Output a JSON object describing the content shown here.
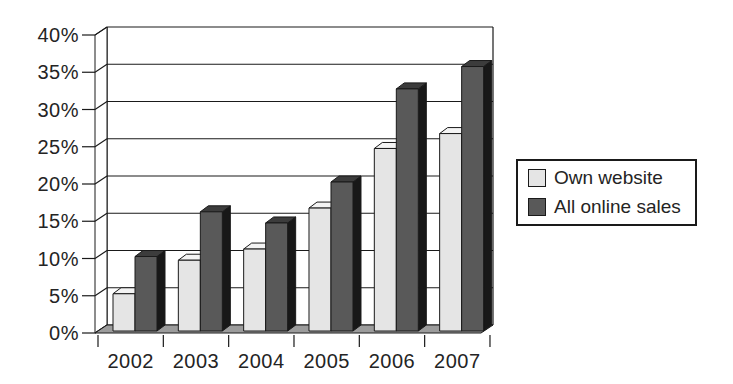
{
  "chart_data": {
    "type": "bar",
    "style": "3d-column",
    "title": "",
    "xlabel": "",
    "ylabel": "",
    "categories": [
      "2002",
      "2003",
      "2004",
      "2005",
      "2006",
      "2007"
    ],
    "series": [
      {
        "name": "Own website",
        "values": [
          5,
          9.5,
          11,
          16.5,
          24.5,
          26.5
        ]
      },
      {
        "name": "All online sales",
        "values": [
          10,
          16,
          14.5,
          20,
          32.5,
          35.5
        ]
      }
    ],
    "y_axis": {
      "min": 0,
      "max": 40,
      "step": 5,
      "tick_labels": [
        "0%",
        "5%",
        "10%",
        "15%",
        "20%",
        "25%",
        "30%",
        "35%",
        "40%"
      ]
    },
    "grid": true,
    "legend_position": "right",
    "colors": {
      "own_website_front": "#e5e5e5",
      "own_website_top": "#f4f4f4",
      "own_website_side": "#a0a0a0",
      "all_online_front": "#595959",
      "all_online_top": "#3c3c3c",
      "all_online_side": "#181818",
      "floor": "#9c9c9c",
      "line": "#1a1a1a",
      "background": "#ffffff"
    }
  }
}
